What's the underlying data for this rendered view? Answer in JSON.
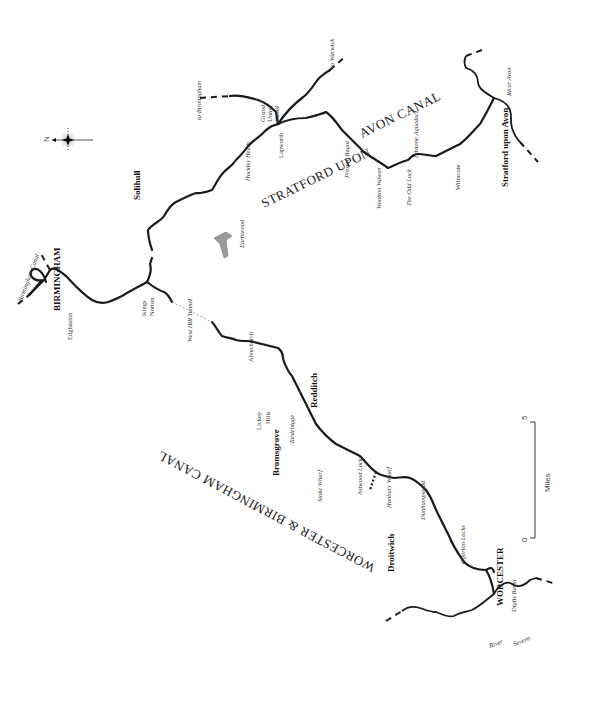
{
  "map": {
    "canal_names": {
      "stratford_1": "STRATFORD UPON",
      "stratford_2": "AVON CANAL",
      "worcester": "WORCESTER & BIRMINGHAM CANAL"
    },
    "towns": {
      "birmingham": "BIRMINGHAM",
      "solihull": "Solihull",
      "redditch": "Redditch",
      "bromsgrove": "Bromsgrove",
      "droitwich": "Droitwich",
      "worcester": "WORCESTER",
      "stratford": "Stratford upon Avon"
    },
    "places": {
      "birmingham_canal": "Birmingham Canal",
      "edgbaston": "Edgbaston",
      "kings": "Kings",
      "norton": "Norton",
      "west_hill_tunnel": "West Hill Tunnel",
      "alvechurch": "Alvechurch",
      "lickey": "Lickey",
      "hills": "Hills",
      "tardebigge": "Tardebigge",
      "stoke_wharf": "Stoke Wharf",
      "astwood_locks": "Astwood Locks",
      "hanbury_wharf": "Hanbury Wharf",
      "dunhampstead": "Dunhampstead",
      "offerton_locks": "Offerton Locks",
      "diglis_basin": "Diglis Basin",
      "river": "River",
      "severn": "Severn",
      "earlswood": "Earlswood",
      "hockley_heath": "Hockley Heath",
      "lapworth": "Lapworth",
      "to_birmingham": "to Birmingham",
      "grand": "Grand",
      "union": "Union",
      "canal": "Canal",
      "to_warwick": "to Warwick",
      "preston_bagot": "Preston Bagot",
      "wootton_wawen": "Wootton Wawen",
      "the_odd_lock": "The Odd Lock",
      "edstone_aqueduct": "Edstone Aqueduct",
      "wilmcote": "Wilmcote",
      "river_avon": "River Avon"
    },
    "compass": {
      "label": "N"
    },
    "scale": {
      "start": "0",
      "end": "5",
      "unit": "Miles"
    },
    "colors": {
      "ink": "#1a1a1a",
      "reservoir": "#9a9a9a",
      "background": "#ffffff"
    }
  }
}
